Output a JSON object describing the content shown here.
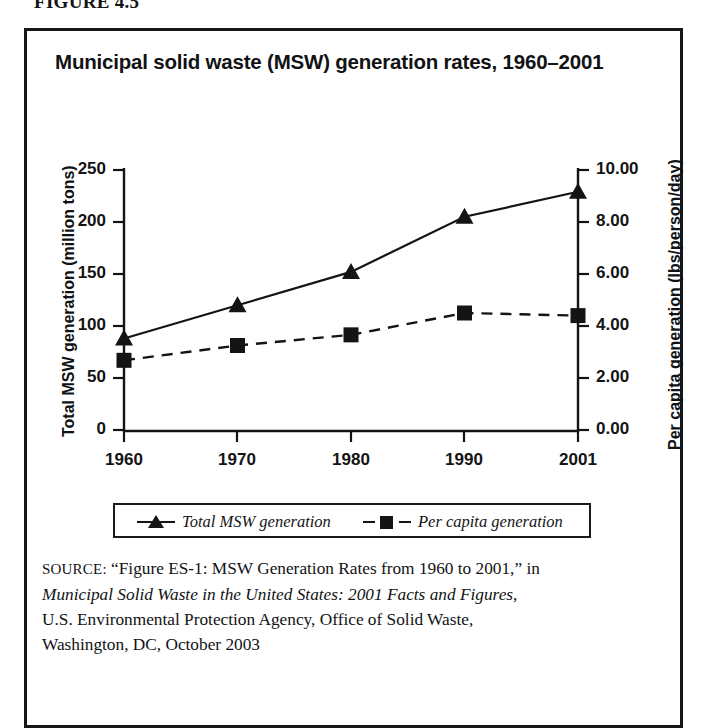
{
  "figure": {
    "caption": "FIGURE 4.5"
  },
  "chart_title": "Municipal solid waste (MSW) generation rates, 1960–2001",
  "axes": {
    "y_left_title": "Total MSW generation (million tons)",
    "y_right_title": "Per capita generation (lbs/person/day)",
    "x_ticks": [
      "1960",
      "1970",
      "1980",
      "1990",
      "2001"
    ],
    "y_left_ticks": [
      "250",
      "200",
      "150",
      "100",
      "50",
      "0"
    ],
    "y_right_ticks": [
      "10.00",
      "8.00",
      "6.00",
      "4.00",
      "2.00",
      "0.00"
    ]
  },
  "legend": {
    "items": [
      {
        "label": "Total MSW generation",
        "marker": "triangle-marker",
        "line": "solid"
      },
      {
        "label": "Per capita generation",
        "marker": "square-marker",
        "line": "dashed"
      }
    ]
  },
  "source": {
    "label": "SOURCE:",
    "line1_part1": " “Figure ES-1: MSW Generation Rates from 1960 to 2001,” in",
    "line2_italic": "Municipal Solid Waste in the United States: 2001 Facts and Figures",
    "line2_tail": ",",
    "line3": "U.S. Environmental Protection Agency, Office of Solid Waste,",
    "line4": "Washington, DC, October 2003"
  },
  "colors": {
    "ink": "#141414",
    "frame": "#16171a",
    "background": "#ffffff"
  },
  "chart_data": {
    "type": "line",
    "title": "Municipal solid waste (MSW) generation rates, 1960–2001",
    "xlabel": "",
    "categories": [
      "1960",
      "1970",
      "1980",
      "1990",
      "2001"
    ],
    "x": [
      1960,
      1970,
      1980,
      1990,
      2001
    ],
    "grid": false,
    "legend_position": "bottom",
    "series": [
      {
        "name": "Total MSW generation",
        "axis": "left",
        "unit": "million tons",
        "marker": "triangle",
        "line_style": "solid",
        "color": "#141414",
        "values": [
          88,
          120,
          152,
          205,
          229
        ]
      },
      {
        "name": "Per capita generation",
        "axis": "right",
        "unit": "lbs/person/day",
        "marker": "square",
        "line_style": "dashed",
        "color": "#141414",
        "values": [
          2.68,
          3.25,
          3.66,
          4.5,
          4.4
        ]
      }
    ],
    "ylim_left": [
      0,
      250
    ],
    "ylim_right": [
      0,
      10
    ],
    "ytick_left": [
      0,
      50,
      100,
      150,
      200,
      250
    ],
    "ytick_right": [
      0,
      2,
      4,
      6,
      8,
      10
    ],
    "ylabel_left": "Total MSW generation (million tons)",
    "ylabel_right": "Per capita generation (lbs/person/day)"
  }
}
